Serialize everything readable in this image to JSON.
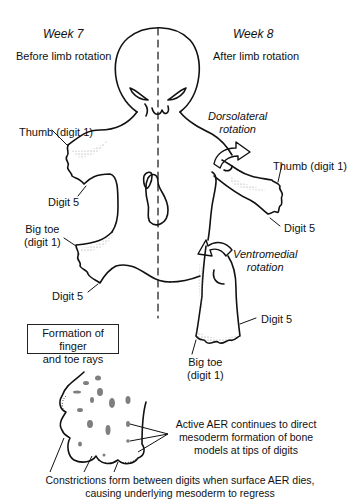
{
  "left_panel": {
    "week": "Week 7",
    "subtitle": "Before limb rotation",
    "labels": {
      "thumb": "Thumb (digit 1)",
      "hand_digit5": "Digit 5",
      "big_toe_line1": "Big toe",
      "big_toe_line2": "(digit 1)",
      "foot_digit5": "Digit 5"
    }
  },
  "right_panel": {
    "week": "Week 8",
    "subtitle": "After limb rotation",
    "upper_rotation_line1": "Dorsolateral",
    "upper_rotation_line2": "rotation",
    "lower_rotation_line1": "Ventromedial",
    "lower_rotation_line2": "rotation",
    "labels": {
      "thumb": "Thumb (digit 1)",
      "hand_digit5": "Digit 5",
      "foot_digit5": "Digit 5",
      "big_toe_line1": "Big toe",
      "big_toe_line2": "(digit 1)"
    }
  },
  "inset": {
    "title_line1": "Formation of finger",
    "title_line2": "and toe rays",
    "aer_note_line1": "Active AER continues to direct",
    "aer_note_line2": "mesoderm formation of bone",
    "aer_note_line3": "models at tips of digits",
    "constriction_note_line1": "Constrictions form between digits when surface AER dies,",
    "constriction_note_line2": "causing underlying mesoderm to regress"
  },
  "colors": {
    "line": "#111111",
    "stipple": "#777777",
    "background": "#ffffff"
  }
}
